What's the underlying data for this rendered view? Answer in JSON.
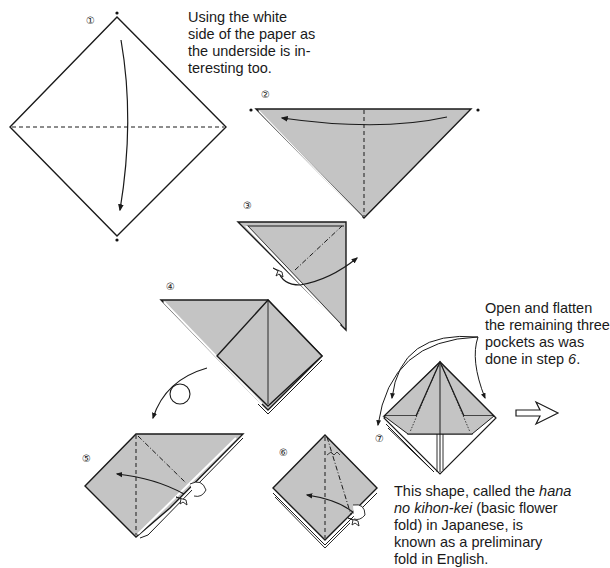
{
  "colors": {
    "paper_color": "#c4c4c4",
    "line": "#1a1a1a",
    "background": "#ffffff"
  },
  "steps": [
    {
      "number": "1",
      "symbol": "①"
    },
    {
      "number": "2",
      "symbol": "②"
    },
    {
      "number": "3",
      "symbol": "③"
    },
    {
      "number": "4",
      "symbol": "④"
    },
    {
      "number": "5",
      "symbol": "⑤"
    },
    {
      "number": "6",
      "symbol": "⑥"
    },
    {
      "number": "7",
      "symbol": "⑦"
    }
  ],
  "notes": {
    "intro": {
      "lines": [
        "Using the white",
        "side of the paper as",
        "the underside is in-",
        "teresting too."
      ]
    },
    "step7": {
      "lines": [
        "Open and flatten",
        "the remaining three",
        "pockets as was",
        "done in step "
      ],
      "step_ref": "6",
      "suffix": "."
    },
    "result": {
      "line1_a": "This shape, called the ",
      "line1_i": "hana",
      "line2_i": "no kihon-kei",
      "line2_a": " (basic flower",
      "line3": "fold) in Japanese, is",
      "line4": "known as a preliminary",
      "line5": "fold in English."
    }
  },
  "icons": {
    "valley_fold_line": "dashed-line",
    "mountain_fold_line": "dash-dot-line",
    "fold_arrow": "curved-arrow",
    "turn_over": "loop-arrow",
    "push_in": "push-arrow",
    "next_step": "outline-arrow"
  }
}
